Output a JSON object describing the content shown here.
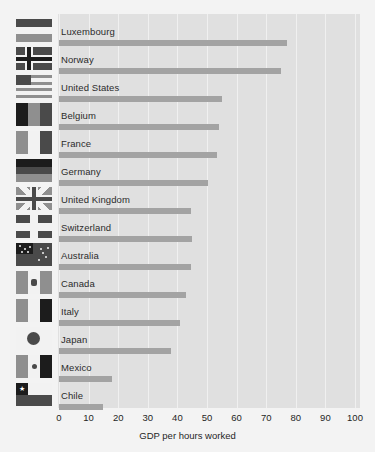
{
  "chart_data": {
    "type": "bar",
    "orientation": "horizontal",
    "title": "",
    "xlabel": "GDP per hours worked",
    "ylabel": "",
    "xlim": [
      0,
      100
    ],
    "xticks": [
      0,
      10,
      20,
      30,
      40,
      50,
      60,
      70,
      80,
      90,
      100
    ],
    "grid": true,
    "legend": "none",
    "categories": [
      "Luxembourg",
      "Norway",
      "United States",
      "Belgium",
      "France",
      "Germany",
      "United Kingdom",
      "Switzerland",
      "Australia",
      "Canada",
      "Italy",
      "Japan",
      "Mexico",
      "Chile"
    ],
    "values": [
      77,
      75,
      55,
      54,
      53.5,
      50.5,
      44.5,
      45,
      44.5,
      43,
      41,
      38,
      18,
      15
    ],
    "bar_color": "#a3a3a3",
    "plot_background": "#e0e0e0",
    "figure_background": "#f3f3f3",
    "gridline_color": "#f0f0f0"
  },
  "rows": [
    {
      "label": "Luxembourg",
      "value": 77,
      "flag": "flag-luxembourg"
    },
    {
      "label": "Norway",
      "value": 75,
      "flag": "flag-norway"
    },
    {
      "label": "United States",
      "value": 55,
      "flag": "flag-united-states"
    },
    {
      "label": "Belgium",
      "value": 54,
      "flag": "flag-belgium"
    },
    {
      "label": "France",
      "value": 53.5,
      "flag": "flag-france"
    },
    {
      "label": "Germany",
      "value": 50.5,
      "flag": "flag-germany"
    },
    {
      "label": "United Kingdom",
      "value": 44.5,
      "flag": "flag-united-kingdom"
    },
    {
      "label": "Switzerland",
      "value": 45,
      "flag": "flag-switzerland"
    },
    {
      "label": "Australia",
      "value": 44.5,
      "flag": "flag-australia"
    },
    {
      "label": "Canada",
      "value": 43,
      "flag": "flag-canada"
    },
    {
      "label": "Italy",
      "value": 41,
      "flag": "flag-italy"
    },
    {
      "label": "Japan",
      "value": 38,
      "flag": "flag-japan"
    },
    {
      "label": "Mexico",
      "value": 18,
      "flag": "flag-mexico"
    },
    {
      "label": "Chile",
      "value": 15,
      "flag": "flag-chile"
    }
  ],
  "axis": {
    "xlabel": "GDP per hours worked",
    "ticks": [
      "0",
      "10",
      "20",
      "30",
      "40",
      "50",
      "60",
      "70",
      "80",
      "90",
      "100"
    ]
  }
}
